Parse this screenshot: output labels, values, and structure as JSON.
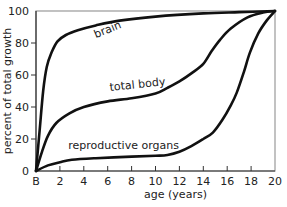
{
  "chart_data": {
    "type": "line",
    "title": "",
    "xlabel": "age (years)",
    "ylabel": "percent of total growth",
    "xlim": [
      0,
      20
    ],
    "ylim": [
      0,
      100
    ],
    "grid": false,
    "legend": "none (curves labeled inline)",
    "x_ticks": [
      {
        "value": 0,
        "label": "B"
      },
      {
        "value": 2,
        "label": "2"
      },
      {
        "value": 4,
        "label": "4"
      },
      {
        "value": 6,
        "label": "6"
      },
      {
        "value": 8,
        "label": "8"
      },
      {
        "value": 10,
        "label": "10"
      },
      {
        "value": 12,
        "label": "12"
      },
      {
        "value": 14,
        "label": "14"
      },
      {
        "value": 16,
        "label": "16"
      },
      {
        "value": 18,
        "label": "18"
      },
      {
        "value": 20,
        "label": "20"
      }
    ],
    "y_ticks": [
      {
        "value": 0,
        "label": "0"
      },
      {
        "value": 20,
        "label": "20"
      },
      {
        "value": 40,
        "label": "40"
      },
      {
        "value": 60,
        "label": "60"
      },
      {
        "value": 80,
        "label": "80"
      },
      {
        "value": 100,
        "label": "100"
      }
    ],
    "series": [
      {
        "name": "brain",
        "label": "brain",
        "label_at": {
          "x": 5.0,
          "y": 83,
          "angle": -22
        },
        "points": [
          [
            0,
            0
          ],
          [
            0.3,
            25
          ],
          [
            0.6,
            50
          ],
          [
            0.9,
            65
          ],
          [
            1.3,
            74
          ],
          [
            1.8,
            81
          ],
          [
            2.5,
            85
          ],
          [
            3.5,
            88
          ],
          [
            5,
            91
          ],
          [
            7,
            94
          ],
          [
            10,
            96.5
          ],
          [
            14,
            98.5
          ],
          [
            17,
            99.3
          ],
          [
            20,
            100
          ]
        ]
      },
      {
        "name": "total body",
        "label": "total body",
        "label_at": {
          "x": 6.2,
          "y": 50,
          "angle": -6
        },
        "points": [
          [
            0,
            0
          ],
          [
            0.5,
            12
          ],
          [
            1,
            22
          ],
          [
            1.7,
            30
          ],
          [
            2.8,
            36
          ],
          [
            4,
            40
          ],
          [
            6,
            43.5
          ],
          [
            8,
            45.5
          ],
          [
            10,
            48.5
          ],
          [
            11,
            52
          ],
          [
            12,
            56
          ],
          [
            13,
            61
          ],
          [
            14,
            67
          ],
          [
            14.7,
            75
          ],
          [
            15.4,
            82
          ],
          [
            16.3,
            89
          ],
          [
            17.7,
            96
          ],
          [
            19,
            99
          ],
          [
            20,
            100
          ]
        ]
      },
      {
        "name": "reproductive organs",
        "label": "reproductive organs",
        "label_at": {
          "x": 2.7,
          "y": 14,
          "angle": 0
        },
        "points": [
          [
            0,
            0
          ],
          [
            1,
            3.5
          ],
          [
            2,
            5.5
          ],
          [
            3,
            7
          ],
          [
            5,
            8
          ],
          [
            8,
            9
          ],
          [
            10,
            9.5
          ],
          [
            11,
            10
          ],
          [
            12,
            12
          ],
          [
            13,
            15.5
          ],
          [
            14,
            20
          ],
          [
            14.8,
            24
          ],
          [
            15.6,
            32
          ],
          [
            16.3,
            41
          ],
          [
            16.8,
            49
          ],
          [
            17.4,
            62
          ],
          [
            17.9,
            74
          ],
          [
            18.6,
            86
          ],
          [
            19.3,
            94
          ],
          [
            20,
            100
          ]
        ]
      }
    ]
  }
}
